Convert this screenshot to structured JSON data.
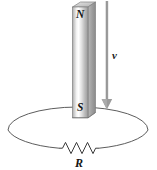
{
  "figure": {
    "background_color": "#ffffff"
  },
  "magnet": {
    "name": "bar-magnet",
    "north_label": "N",
    "south_label": "S",
    "body_color_light": "#fcfcfc",
    "body_color_mid": "#cfcfcf",
    "body_color_dark": "#8e8e8e",
    "outline_color": "#7a7a7a",
    "x": 72,
    "y": 2,
    "width": 23,
    "height": 116
  },
  "velocity_arrow": {
    "name": "velocity-arrow",
    "label": "v",
    "color": "#9a9a9a",
    "direction": "down",
    "x": 107,
    "y_start": 1,
    "y_end": 108,
    "label_x": 112,
    "label_y": 58
  },
  "loop": {
    "name": "conducting-loop",
    "shape": "ellipse",
    "center_x": 78,
    "center_y": 130,
    "radius_x": 70,
    "radius_y": 23,
    "stroke_color": "#4a4a4a",
    "stroke_width": 0.9
  },
  "resistor": {
    "name": "resistor",
    "label": "R",
    "peaks": 6,
    "x_start": 59,
    "x_end": 99,
    "y": 148,
    "amplitude": 6,
    "stroke_color": "#3a3a3a",
    "label_x": 79,
    "label_y": 166
  }
}
